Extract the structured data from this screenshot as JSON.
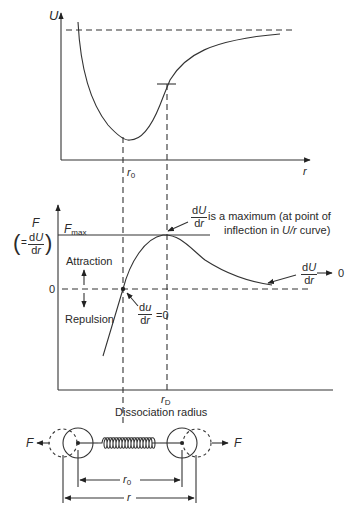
{
  "figure": {
    "top_chart": {
      "y_axis_label": "U",
      "x_axis_label": "r",
      "r0_label": "r",
      "r0_sub": "0"
    },
    "middle_chart": {
      "y_axis_label_F": "F",
      "y_axis_label_paren_open": "(",
      "y_axis_label_eq": "=",
      "y_axis_label_num": "dU",
      "y_axis_label_den": "dr",
      "y_axis_label_paren_close": ")",
      "fmax_label": "F",
      "fmax_sub": "max",
      "zero_label": "0",
      "attraction_label": "Attraction",
      "repulsion_label": "Repulsion",
      "max_annot_num": "dU",
      "max_annot_den": "dr",
      "max_annot_line1": "is a maximum (at point of",
      "max_annot_line2_pre": "inflection in ",
      "max_annot_line2_ital": "U/r",
      "max_annot_line2_post": " curve)",
      "zero_annot_num": "du",
      "zero_annot_den": "dr",
      "zero_annot_eq": "=0",
      "tail_annot_num": "dU",
      "tail_annot_den": "dr",
      "tail_annot_arrow_val": "0",
      "rd_label": "r",
      "rd_sub": "D",
      "dissociation_label": "Dissociation radius"
    },
    "spring_diagram": {
      "left_force": "F",
      "right_force": "F",
      "r0_label": "r",
      "r0_sub": "0",
      "r_label": "r"
    }
  }
}
